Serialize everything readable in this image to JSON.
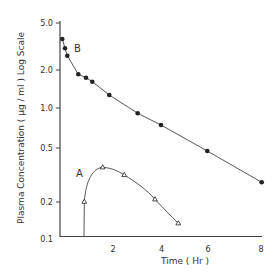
{
  "chart_data": {
    "type": "line",
    "title": "",
    "xlabel": "Time ( Hr )",
    "ylabel": "Plasma Concentration ( µg / ml )  Log Scale",
    "yscale": "log",
    "xlim": [
      0,
      8
    ],
    "ylim": [
      0.1,
      5.0
    ],
    "x_ticks": [
      2,
      4,
      6,
      8
    ],
    "x_tick_labels": [
      "2",
      "4",
      "6",
      "8"
    ],
    "y_ticks": [
      5.0,
      2.0,
      1.0,
      0.5,
      0.2,
      0.1
    ],
    "y_tick_labels": [
      "5.0",
      "2.0",
      "1.0",
      "0.5",
      "0.2",
      "0.1"
    ],
    "grid": false,
    "legend": "none (inline labels A and B)",
    "series": [
      {
        "name": "B",
        "marker": "filled-circle",
        "x": [
          0.1,
          0.2,
          0.3,
          0.6,
          0.9,
          1.2,
          1.8,
          3.0,
          3.9,
          5.8,
          8.0
        ],
        "y": [
          3.66,
          3.05,
          2.64,
          1.85,
          1.74,
          1.62,
          1.27,
          0.91,
          0.745,
          0.475,
          0.28
        ]
      },
      {
        "name": "A",
        "marker": "open-triangle",
        "x": [
          0.85,
          1.6,
          2.5,
          3.7,
          4.65
        ],
        "y": [
          0.2,
          0.36,
          0.32,
          0.21,
          0.13
        ],
        "start_from_axis_at_x": 0.85
      }
    ]
  },
  "labels": {
    "series_a": "A",
    "series_b": "B",
    "xlabel": "Time ( Hr )",
    "ylabel": "Plasma Concentration ( µg / ml )   Log Scale"
  },
  "colors": {
    "line": "#444444",
    "marker": "#222222",
    "text": "#333333"
  }
}
